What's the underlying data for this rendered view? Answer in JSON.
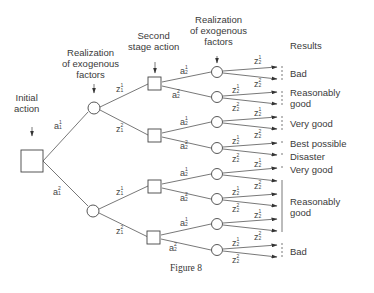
{
  "headers": {
    "initial_action": [
      "Initial",
      "action"
    ],
    "realization1": [
      "Realization",
      "of exogenous",
      "factors"
    ],
    "second_stage": [
      "Second",
      "stage action"
    ],
    "realization2": [
      "Realization",
      "of exogenous",
      "factors"
    ],
    "results": "Results"
  },
  "first_actions": [
    {
      "var": "a",
      "sup": "1",
      "sub": "1"
    },
    {
      "var": "a",
      "sup": "2",
      "sub": "1"
    }
  ],
  "first_realizations": [
    {
      "var": "z",
      "sup": "1",
      "sub": "1"
    },
    {
      "var": "z",
      "sup": "2",
      "sub": "1"
    }
  ],
  "second_actions": [
    {
      "var": "a",
      "sup": "1",
      "sub": "2"
    },
    {
      "var": "a",
      "sup": "2",
      "sub": "2"
    }
  ],
  "second_realizations": [
    {
      "var": "z",
      "sup": "1",
      "sub": "2"
    },
    {
      "var": "z",
      "sup": "2",
      "sub": "2"
    }
  ],
  "results": [
    {
      "label": "Bad"
    },
    {
      "label": "Reasonably good",
      "lines": [
        "Reasonably",
        "good"
      ]
    },
    {
      "label": "Very good"
    },
    {
      "label": "Best possible"
    },
    {
      "label": "Disaster"
    },
    {
      "label": "Very good"
    },
    {
      "label": "Reasonably good",
      "lines": [
        "Reasonably",
        "good"
      ]
    },
    {
      "label": "Bad"
    }
  ],
  "caption": "Figure 8"
}
